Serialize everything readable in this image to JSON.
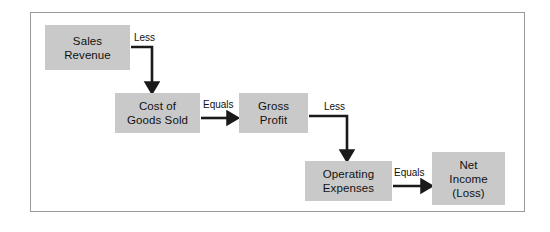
{
  "diagram": {
    "frame": {
      "border_color": "#9a9a9a",
      "background": "#ffffff"
    },
    "node_fill": "#c9c9c9",
    "text_color": "#111111",
    "nodes": [
      {
        "id": "sales-revenue",
        "lines": [
          "Sales",
          "Revenue"
        ],
        "x": 45,
        "y": 25,
        "w": 85,
        "h": 45
      },
      {
        "id": "cost-of-goods-sold",
        "lines": [
          "Cost of",
          "Goods Sold"
        ],
        "x": 115,
        "y": 93,
        "w": 85,
        "h": 40
      },
      {
        "id": "gross-profit",
        "lines": [
          "Gross",
          "Profit"
        ],
        "x": 239,
        "y": 93,
        "w": 69,
        "h": 40
      },
      {
        "id": "operating-expenses",
        "lines": [
          "Operating",
          "Expenses"
        ],
        "x": 305,
        "y": 161,
        "w": 87,
        "h": 40
      },
      {
        "id": "net-income",
        "lines": [
          "Net",
          "Income",
          "(Loss)"
        ],
        "x": 432,
        "y": 152,
        "w": 73,
        "h": 53
      }
    ],
    "edges": [
      {
        "id": "sales-to-cogs",
        "label": "Less",
        "label_x": 134,
        "label_y": 32,
        "kind": "elbow",
        "from": "sales-revenue",
        "to": "cost-of-goods-sold"
      },
      {
        "id": "cogs-to-gross-profit",
        "label": "Equals",
        "label_x": 203,
        "label_y": 99,
        "kind": "straight",
        "from": "cost-of-goods-sold",
        "to": "gross-profit"
      },
      {
        "id": "gross-profit-to-opex",
        "label": "Less",
        "label_x": 324,
        "label_y": 101,
        "kind": "elbow",
        "from": "gross-profit",
        "to": "operating-expenses"
      },
      {
        "id": "opex-to-net-income",
        "label": "Equals",
        "label_x": 394,
        "label_y": 167,
        "kind": "straight",
        "from": "operating-expenses",
        "to": "net-income"
      }
    ]
  }
}
